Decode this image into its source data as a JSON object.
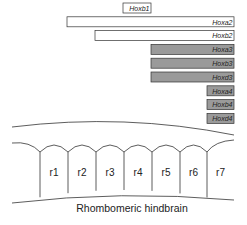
{
  "diagram": {
    "caption": "Rhombomeric hindbrain",
    "rhombomeres": [
      "r1",
      "r2",
      "r3",
      "r4",
      "r5",
      "r6",
      "r7"
    ],
    "genes": [
      {
        "name": "Hoxb1",
        "from": 4,
        "to": 4,
        "shaded": false
      },
      {
        "name": "Hoxa2",
        "from": 2,
        "to": 7,
        "shaded": false
      },
      {
        "name": "Hoxb2",
        "from": 3,
        "to": 7,
        "shaded": false
      },
      {
        "name": "Hoxa3",
        "from": 5,
        "to": 7,
        "shaded": true
      },
      {
        "name": "Hoxb3",
        "from": 5,
        "to": 7,
        "shaded": true
      },
      {
        "name": "Hoxd3",
        "from": 5,
        "to": 7,
        "shaded": true
      },
      {
        "name": "Hoxa4",
        "from": 7,
        "to": 7,
        "shaded": true
      },
      {
        "name": "Hoxb4",
        "from": 7,
        "to": 7,
        "shaded": true
      },
      {
        "name": "Hoxd4",
        "from": 7,
        "to": 7,
        "shaded": true
      }
    ],
    "colors": {
      "shaded": "#9a9a9a",
      "unshaded": "#ffffff",
      "stroke": "#333333"
    }
  }
}
